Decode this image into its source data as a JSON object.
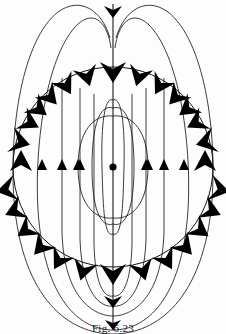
{
  "figure": {
    "caption": "Fig. 6.23",
    "kind": "magnetic-dipole-field-diagram",
    "colors": {
      "line": "#1a1a1a",
      "arrow": "#000000",
      "background": "#ffffff"
    },
    "center_dot": {
      "label": "dipole",
      "cx": 113,
      "cy": 167,
      "r": 3.4
    },
    "sphere": {
      "label": "spherical surface",
      "cx": 113,
      "cy": 167,
      "r": 100
    },
    "axis": {
      "label": "dipole axis",
      "x": 113,
      "y_top": 4,
      "y_bottom": 330
    },
    "field_direction_top": "downward",
    "field_direction_bottom": "downward",
    "field_direction_sides": "upward",
    "arrow_counts": {
      "large_on_sphere": 24,
      "small_on_lines": 8,
      "axis_arrows": 3
    },
    "inner_loops": 2,
    "outer_loops": 6
  }
}
